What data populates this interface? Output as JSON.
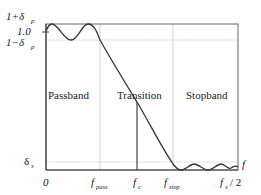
{
  "diagram": {
    "y_labels": {
      "upper": "1+δ",
      "upper_sub": "p",
      "unity": "1.0",
      "lower": "1−δ",
      "lower_sub": "p",
      "stop": "δ",
      "stop_sub": "s"
    },
    "x_labels": {
      "origin": "0",
      "pass": "f",
      "pass_sub": "pass",
      "cutoff": "f",
      "cutoff_sub": "c",
      "stop": "f",
      "stop_sub": "stop",
      "nyquist": "f",
      "nyquist_sub": "s",
      "nyquist_suffix": "/ 2",
      "axis": "f"
    },
    "regions": {
      "passband": "Passband",
      "transition": "Transition",
      "stopband": "Stopband"
    },
    "colors": {
      "curve": "#333333",
      "frame": "#555555",
      "guide": "#bbbbbb"
    }
  }
}
